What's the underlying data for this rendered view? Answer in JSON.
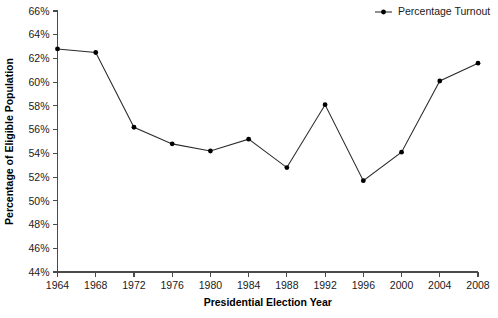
{
  "chart_data": {
    "type": "line",
    "title": "",
    "xlabel": "Presidential Election Year",
    "ylabel": "Percentage of Eligible Population",
    "categories": [
      1964,
      1968,
      1972,
      1976,
      1980,
      1984,
      1988,
      1992,
      1996,
      2000,
      2004,
      2008
    ],
    "x": [
      1964,
      1968,
      1972,
      1976,
      1980,
      1984,
      1988,
      1992,
      1996,
      2000,
      2004,
      2008
    ],
    "series": [
      {
        "name": "Percentage Turnout",
        "values": [
          62.8,
          62.5,
          56.2,
          54.8,
          54.2,
          55.2,
          52.8,
          58.1,
          51.7,
          54.1,
          60.1,
          61.6
        ],
        "color": "#000000",
        "marker": "filled-circle"
      }
    ],
    "xlim": [
      1964,
      2008
    ],
    "ylim": [
      44,
      66
    ],
    "y_tick_step": 2,
    "x_tick_step": 4,
    "grid": false,
    "legend_position": "top-right",
    "y_tick_labels": [
      "44%",
      "46%",
      "48%",
      "50%",
      "52%",
      "54%",
      "56%",
      "58%",
      "60%",
      "62%",
      "64%",
      "66%"
    ],
    "x_tick_labels": [
      "1964",
      "1968",
      "1972",
      "1976",
      "1980",
      "1984",
      "1988",
      "1992",
      "1996",
      "2000",
      "2004",
      "2008"
    ],
    "legend_entries": [
      "Percentage Turnout"
    ]
  },
  "axes": {
    "x_title": "Presidential Election Year",
    "y_title": "Percentage of Eligible Population"
  },
  "legend": {
    "items": [
      {
        "label": "Percentage Turnout"
      }
    ]
  },
  "colors": {
    "series": "#000000",
    "axis": "#4a4a4a",
    "text": "#1a1a1a",
    "background": "#ffffff"
  }
}
